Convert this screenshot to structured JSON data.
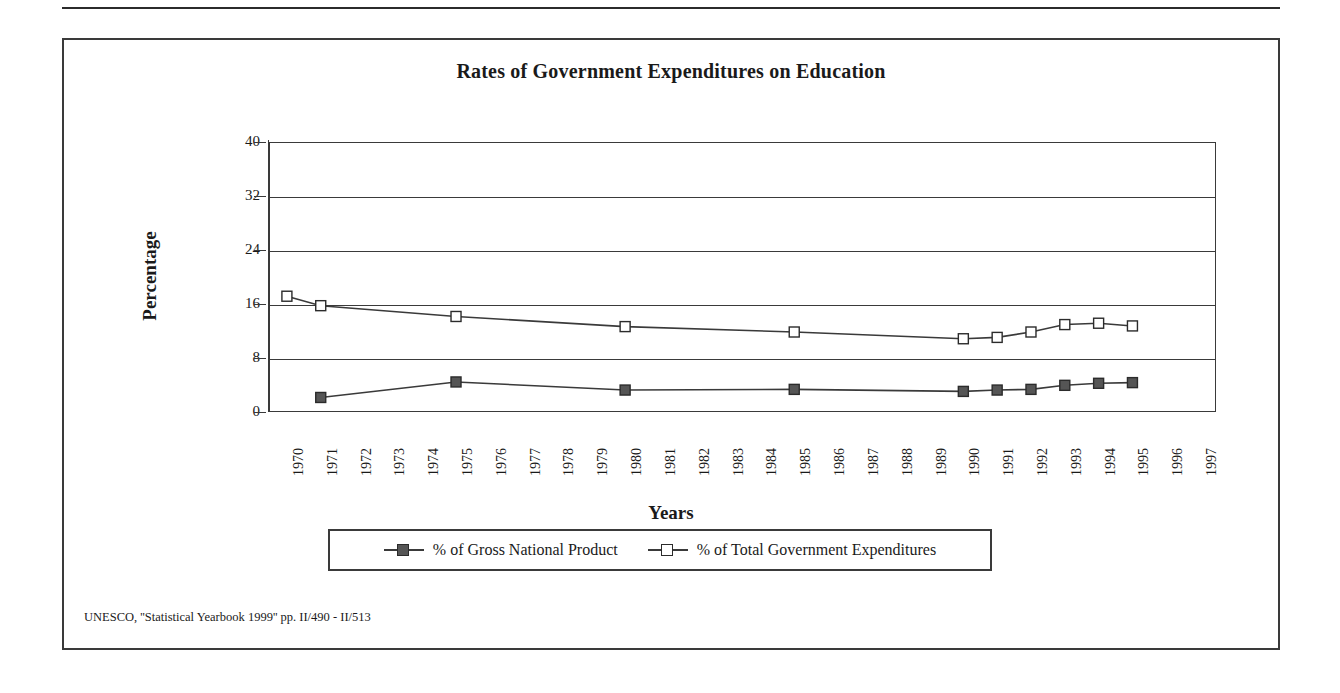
{
  "figure": {
    "title": "Rates of Government Expenditures on Education",
    "source_note": "UNESCO, ''Statistical Yearbook 1999'' pp. II/490 - II/513",
    "frame_color": "#3a3a3a"
  },
  "chart_data": {
    "type": "line",
    "title": "Rates of Government Expenditures on Education",
    "xlabel": "Years",
    "ylabel": "Percentage",
    "ylim": [
      0,
      40
    ],
    "yticks": [
      0,
      8,
      16,
      24,
      32,
      40
    ],
    "grid": true,
    "legend_position": "bottom",
    "categories": [
      "1970",
      "1971",
      "1972",
      "1973",
      "1974",
      "1975",
      "1976",
      "1977",
      "1978",
      "1979",
      "1980",
      "1981",
      "1982",
      "1983",
      "1984",
      "1985",
      "1986",
      "1987",
      "1988",
      "1989",
      "1990",
      "1991",
      "1992",
      "1993",
      "1994",
      "1995",
      "1996",
      "1997"
    ],
    "series": [
      {
        "name": "% of Gross National Product",
        "marker": "filled-square",
        "color": "#555555",
        "points": [
          {
            "x": "1971",
            "y": 2.3
          },
          {
            "x": "1975",
            "y": 4.6
          },
          {
            "x": "1980",
            "y": 3.4
          },
          {
            "x": "1985",
            "y": 3.5
          },
          {
            "x": "1990",
            "y": 3.2
          },
          {
            "x": "1991",
            "y": 3.4
          },
          {
            "x": "1992",
            "y": 3.5
          },
          {
            "x": "1993",
            "y": 4.1
          },
          {
            "x": "1994",
            "y": 4.4
          },
          {
            "x": "1995",
            "y": 4.5
          }
        ]
      },
      {
        "name": "% of Total Government Expenditures",
        "marker": "hollow-square",
        "color": "#ffffff",
        "points": [
          {
            "x": "1970",
            "y": 17.3
          },
          {
            "x": "1971",
            "y": 15.9
          },
          {
            "x": "1975",
            "y": 14.3
          },
          {
            "x": "1980",
            "y": 12.8
          },
          {
            "x": "1985",
            "y": 12.0
          },
          {
            "x": "1990",
            "y": 11.0
          },
          {
            "x": "1991",
            "y": 11.2
          },
          {
            "x": "1992",
            "y": 12.0
          },
          {
            "x": "1993",
            "y": 13.1
          },
          {
            "x": "1994",
            "y": 13.3
          },
          {
            "x": "1995",
            "y": 12.9
          }
        ]
      }
    ]
  },
  "legend": {
    "entries": [
      {
        "label": "% of Gross National Product",
        "marker": "filled-square"
      },
      {
        "label": "% of Total Government Expenditures",
        "marker": "hollow-square"
      }
    ]
  }
}
